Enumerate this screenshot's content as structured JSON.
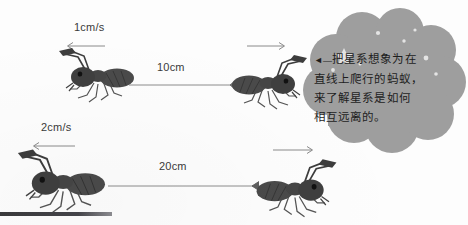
{
  "figure": {
    "background_color": "#fdfdfd",
    "rows": [
      {
        "id": "row-top",
        "speed_label": "1cm/s",
        "distance_label": "10cm",
        "left_ant_direction": "left",
        "right_ant_direction": "right"
      },
      {
        "id": "row-bottom",
        "speed_label": "2cm/s",
        "distance_label": "20cm",
        "left_ant_direction": "left",
        "right_ant_direction": "right"
      }
    ]
  },
  "callout": {
    "shape": "cloud",
    "fill_color": "#9e9e9e",
    "star_color": "#e8e8e8",
    "caret": "◄—",
    "lines": [
      "把星系想象为在",
      "直线上爬行的蚂蚁，",
      "来了解星系是如何",
      "相互远离的。"
    ],
    "text_full": "◄—把星系想象为在直线上爬行的蚂蚁，来了解星系是如何相互远离的。"
  },
  "decor": {
    "bottom_bar_color": "#3a3a3c",
    "line_color": "#8c8c8c",
    "ant_body_color": "#4a4a4a"
  }
}
